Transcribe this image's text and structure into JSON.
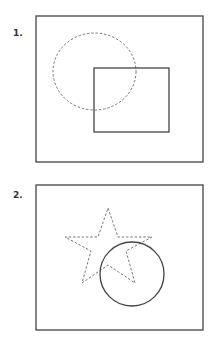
{
  "panels": [
    {
      "label": "1.",
      "frame": {
        "x": 36,
        "y": 16,
        "w": 167,
        "h": 146
      },
      "dashed_shape": {
        "type": "ellipse",
        "cx": 94.5,
        "cy": 71.5,
        "rx": 41.5,
        "ry": 38.5
      },
      "solid_shape": {
        "type": "rect",
        "x": 94,
        "y": 68,
        "w": 75,
        "h": 64
      }
    },
    {
      "label": "2.",
      "frame": {
        "x": 36,
        "y": 185,
        "w": 167,
        "h": 145
      },
      "dashed_shape": {
        "type": "star",
        "points": "108,208 118,237 152,237 126,251 135,283 108,265 82,283 91,251 65,237 98,237"
      },
      "solid_shape": {
        "type": "circle",
        "cx": 132,
        "cy": 274,
        "r": 32
      }
    }
  ],
  "colors": {
    "stroke": "#444444",
    "dashed": "#666666"
  }
}
